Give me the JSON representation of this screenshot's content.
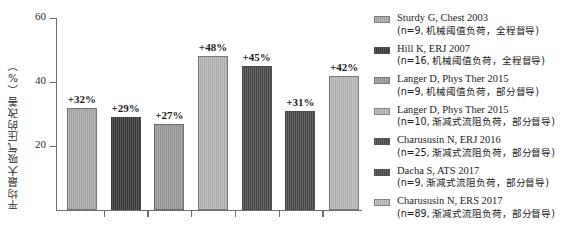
{
  "chart_data": {
    "type": "bar",
    "title": "",
    "xlabel": "",
    "ylabel": "平均最大吸气压的改善（%）",
    "ylim": [
      0,
      60
    ],
    "yticks": [
      20,
      40,
      60
    ],
    "ytick_labels": [
      "20",
      "40",
      "60"
    ],
    "grid": false,
    "legend_position": "right",
    "categories": [
      "Sturdy G, Chest 2003",
      "Hill K, ERJ 2007",
      "Langer D, Phys Ther 2015",
      "Langer D, Phys Ther 2015",
      "Charususin N, ERJ 2016",
      "Dacha S, ATS 2017",
      "Charususin N, ERS 2017"
    ],
    "values": [
      32,
      29,
      27,
      48,
      45,
      31,
      42
    ],
    "data_labels": [
      "+32%",
      "+29%",
      "+27%",
      "+48%",
      "+45%",
      "+31%",
      "+42%"
    ],
    "bar_colors": [
      "#a9a9a9",
      "#3a3a3a",
      "#9a9a9a",
      "#b5b5b5",
      "#4a4a4a",
      "#4a4a4a",
      "#b8b8b8"
    ]
  },
  "axis": {
    "y_title": "平均最大吸气压的改善（%）",
    "tick_60": "60",
    "tick_40": "40",
    "tick_20": "20"
  },
  "legend": {
    "items": [
      {
        "reference": "Sturdy G, Chest 2003",
        "detail": "(n=9, 机械阈值负荷，全程督导)",
        "color": "#a9a9a9"
      },
      {
        "reference": "Hill K, ERJ 2007",
        "detail": "(n=16, 机械阈值负荷，全程督导)",
        "color": "#3a3a3a"
      },
      {
        "reference": "Langer D, Phys Ther 2015",
        "detail": "(n=9, 机械阈值负荷，部分督导)",
        "color": "#9a9a9a"
      },
      {
        "reference": "Langer D, Phys Ther 2015",
        "detail": "(n=10, 渐减式流阻负荷，部分督导)",
        "color": "#b5b5b5"
      },
      {
        "reference": "Charususin N, ERJ 2016",
        "detail": "(n=25, 渐减式流阻负荷，部分督导)",
        "color": "#4a4a4a"
      },
      {
        "reference": "Dacha S, ATS 2017",
        "detail": "(n=9, 渐减式流阻负荷，部分督导)",
        "color": "#4a4a4a"
      },
      {
        "reference": "Charususin N, ERS 2017",
        "detail": "(n=89, 渐减式流阻负荷，部分督导)",
        "color": "#b8b8b8"
      }
    ]
  }
}
